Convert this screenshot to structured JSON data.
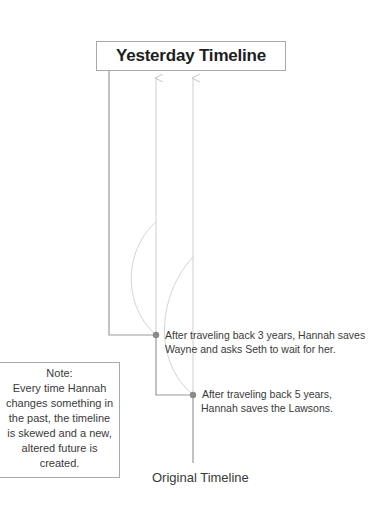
{
  "title": "Yesterday Timeline",
  "events": [
    {
      "lines": [
        "After traveling back 3 years, Hannah saves",
        "Wayne and asks Seth to wait for her."
      ]
    },
    {
      "lines": [
        "After traveling back 5 years,",
        "Hannah saves the Lawsons."
      ]
    }
  ],
  "note": {
    "heading": "Note:",
    "lines": [
      "Every time Hannah",
      "changes something in",
      "the past, the timeline",
      "is skewed and a new,",
      "altered future is",
      "created."
    ]
  },
  "original_timeline_label": "Original Timeline",
  "colors": {
    "main_line": "#9a9a9a",
    "branch_line": "#cfcfcf",
    "dot": "#8a8a8a",
    "border": "#a8a8a8"
  }
}
